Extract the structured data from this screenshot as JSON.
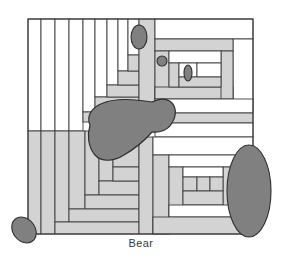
{
  "figure": {
    "caption": "Bear",
    "title": "Bear",
    "type": "quilt-block-diagram",
    "canvas": {
      "width": 282,
      "height": 266
    }
  },
  "colors": {
    "background": "#ffffff",
    "patch_light": "#ffffff",
    "patch_gray": "#d3d3d3",
    "applique_dark": "#808080",
    "outline": "#3c3c3c",
    "caption_text": "#3a3a3a"
  },
  "block": {
    "bounds": {
      "x": 28,
      "y": 19,
      "width": 225,
      "height": 215
    },
    "patches": [
      {
        "name": "strip-left-1",
        "x": 28,
        "y": 19,
        "w": 13,
        "h": 112,
        "fill": "#ffffff"
      },
      {
        "name": "strip-left-2",
        "x": 41,
        "y": 19,
        "w": 14,
        "h": 112,
        "fill": "#ffffff"
      },
      {
        "name": "strip-left-3",
        "x": 55,
        "y": 19,
        "w": 14,
        "h": 112,
        "fill": "#ffffff"
      },
      {
        "name": "strip-left-4",
        "x": 69,
        "y": 19,
        "w": 14,
        "h": 112,
        "fill": "#ffffff"
      },
      {
        "name": "strip-left-5",
        "x": 83,
        "y": 19,
        "w": 12,
        "h": 93,
        "fill": "#ffffff"
      },
      {
        "name": "strip-left-6",
        "x": 95,
        "y": 19,
        "w": 12,
        "h": 78,
        "fill": "#ffffff"
      },
      {
        "name": "strip-left-7",
        "x": 107,
        "y": 19,
        "w": 11,
        "h": 66,
        "fill": "#ffffff"
      },
      {
        "name": "strip-left-8",
        "x": 118,
        "y": 19,
        "w": 10,
        "h": 52,
        "fill": "#ffffff"
      },
      {
        "name": "strip-left-9",
        "x": 128,
        "y": 19,
        "w": 11,
        "h": 36,
        "fill": "#ffffff"
      },
      {
        "name": "step-gray-1",
        "x": 83,
        "y": 112,
        "w": 56,
        "h": 10,
        "fill": "#d3d3d3"
      },
      {
        "name": "step-gray-2",
        "x": 95,
        "y": 97,
        "w": 44,
        "h": 15,
        "fill": "#d3d3d3"
      },
      {
        "name": "step-gray-3",
        "x": 107,
        "y": 85,
        "w": 32,
        "h": 12,
        "fill": "#d3d3d3"
      },
      {
        "name": "step-gray-4",
        "x": 118,
        "y": 71,
        "w": 21,
        "h": 14,
        "fill": "#d3d3d3"
      },
      {
        "name": "step-gray-5",
        "x": 128,
        "y": 55,
        "w": 11,
        "h": 16,
        "fill": "#d3d3d3"
      },
      {
        "name": "neck-column",
        "x": 139,
        "y": 19,
        "w": 16,
        "h": 112,
        "fill": "#d3d3d3"
      },
      {
        "name": "head-top-white",
        "x": 155,
        "y": 19,
        "w": 98,
        "h": 20,
        "fill": "#ffffff"
      },
      {
        "name": "head-right-white",
        "x": 233,
        "y": 39,
        "w": 20,
        "h": 72,
        "fill": "#ffffff"
      },
      {
        "name": "head-gray-outer",
        "x": 155,
        "y": 39,
        "w": 78,
        "h": 12,
        "fill": "#d3d3d3"
      },
      {
        "name": "head-left-gray",
        "x": 155,
        "y": 51,
        "w": 14,
        "h": 48,
        "fill": "#d3d3d3"
      },
      {
        "name": "head-bottom-gray",
        "x": 155,
        "y": 87,
        "w": 78,
        "h": 12,
        "fill": "#d3d3d3"
      },
      {
        "name": "head-right-gray",
        "x": 221,
        "y": 51,
        "w": 12,
        "h": 48,
        "fill": "#d3d3d3"
      },
      {
        "name": "muzzle-white-1",
        "x": 169,
        "y": 51,
        "w": 52,
        "h": 12,
        "fill": "#ffffff"
      },
      {
        "name": "muzzle-left-gray",
        "x": 169,
        "y": 63,
        "w": 10,
        "h": 24,
        "fill": "#d3d3d3"
      },
      {
        "name": "muzzle-cell-1",
        "x": 179,
        "y": 63,
        "w": 18,
        "h": 14,
        "fill": "#ffffff"
      },
      {
        "name": "muzzle-cell-2",
        "x": 197,
        "y": 63,
        "w": 24,
        "h": 14,
        "fill": "#ffffff"
      },
      {
        "name": "muzzle-bottom-gray",
        "x": 179,
        "y": 77,
        "w": 42,
        "h": 10,
        "fill": "#d3d3d3"
      },
      {
        "name": "chest-white-band",
        "x": 155,
        "y": 99,
        "w": 98,
        "h": 14,
        "fill": "#ffffff"
      },
      {
        "name": "back-gray-band",
        "x": 155,
        "y": 113,
        "w": 98,
        "h": 10,
        "fill": "#d3d3d3"
      },
      {
        "name": "back-white-band",
        "x": 155,
        "y": 123,
        "w": 98,
        "h": 14,
        "fill": "#ffffff"
      },
      {
        "name": "body-left-gray",
        "x": 28,
        "y": 131,
        "w": 13,
        "h": 103,
        "fill": "#d3d3d3"
      },
      {
        "name": "body-strip-2",
        "x": 41,
        "y": 131,
        "w": 14,
        "h": 103,
        "fill": "#d3d3d3"
      },
      {
        "name": "body-strip-3",
        "x": 55,
        "y": 131,
        "w": 14,
        "h": 91,
        "fill": "#d3d3d3"
      },
      {
        "name": "body-strip-4",
        "x": 69,
        "y": 131,
        "w": 16,
        "h": 78,
        "fill": "#d3d3d3"
      },
      {
        "name": "body-strip-5",
        "x": 85,
        "y": 131,
        "w": 14,
        "h": 64,
        "fill": "#d3d3d3"
      },
      {
        "name": "body-strip-6",
        "x": 99,
        "y": 131,
        "w": 14,
        "h": 50,
        "fill": "#d3d3d3"
      },
      {
        "name": "body-strip-7",
        "x": 113,
        "y": 131,
        "w": 26,
        "h": 36,
        "fill": "#d3d3d3"
      },
      {
        "name": "body-step-1",
        "x": 99,
        "y": 181,
        "w": 40,
        "h": 14,
        "fill": "#d3d3d3"
      },
      {
        "name": "body-step-2",
        "x": 85,
        "y": 195,
        "w": 54,
        "h": 14,
        "fill": "#d3d3d3"
      },
      {
        "name": "body-step-3",
        "x": 69,
        "y": 209,
        "w": 70,
        "h": 13,
        "fill": "#d3d3d3"
      },
      {
        "name": "body-step-4",
        "x": 55,
        "y": 222,
        "w": 84,
        "h": 12,
        "fill": "#d3d3d3"
      },
      {
        "name": "inner-step-a",
        "x": 113,
        "y": 167,
        "w": 26,
        "h": 14,
        "fill": "#d3d3d3"
      },
      {
        "name": "center-divider",
        "x": 139,
        "y": 137,
        "w": 14,
        "h": 97,
        "fill": "#d3d3d3"
      },
      {
        "name": "hind-white-band",
        "x": 153,
        "y": 137,
        "w": 100,
        "h": 18,
        "fill": "#ffffff"
      },
      {
        "name": "hind-left-gray",
        "x": 153,
        "y": 155,
        "w": 16,
        "h": 79,
        "fill": "#d3d3d3"
      },
      {
        "name": "hind-white-2",
        "x": 169,
        "y": 155,
        "w": 84,
        "h": 12,
        "fill": "#ffffff"
      },
      {
        "name": "hind-inner-left",
        "x": 169,
        "y": 167,
        "w": 14,
        "h": 50,
        "fill": "#d3d3d3"
      },
      {
        "name": "hind-inner-right",
        "x": 223,
        "y": 167,
        "w": 14,
        "h": 50,
        "fill": "#d3d3d3"
      },
      {
        "name": "hind-inner-white",
        "x": 183,
        "y": 167,
        "w": 40,
        "h": 10,
        "fill": "#ffffff"
      },
      {
        "name": "paw-cell-1",
        "x": 183,
        "y": 177,
        "w": 14,
        "h": 14,
        "fill": "#d3d3d3"
      },
      {
        "name": "paw-cell-2",
        "x": 197,
        "y": 177,
        "w": 13,
        "h": 14,
        "fill": "#d3d3d3"
      },
      {
        "name": "paw-cell-3",
        "x": 210,
        "y": 177,
        "w": 13,
        "h": 14,
        "fill": "#d3d3d3"
      },
      {
        "name": "hind-inner-bottom",
        "x": 183,
        "y": 191,
        "w": 40,
        "h": 14,
        "fill": "#d3d3d3"
      },
      {
        "name": "hind-white-3",
        "x": 169,
        "y": 205,
        "w": 68,
        "h": 12,
        "fill": "#ffffff"
      },
      {
        "name": "hind-bottom-gray",
        "x": 153,
        "y": 217,
        "w": 100,
        "h": 17,
        "fill": "#d3d3d3"
      },
      {
        "name": "hind-right-gray",
        "x": 237,
        "y": 155,
        "w": 16,
        "h": 62,
        "fill": "#d3d3d3"
      }
    ],
    "appliques": [
      {
        "name": "bear-body-blob",
        "shape": "blob",
        "label": "body"
      },
      {
        "name": "bear-ear-oval",
        "shape": "ellipse",
        "cx": 139,
        "cy": 37,
        "rx": 8,
        "ry": 12,
        "rotation": 0
      },
      {
        "name": "bear-eye-oval",
        "shape": "ellipse",
        "cx": 162,
        "cy": 61,
        "rx": 5,
        "ry": 5,
        "rotation": 0
      },
      {
        "name": "bear-nose-oval",
        "shape": "ellipse",
        "cx": 188,
        "cy": 73,
        "rx": 4,
        "ry": 8,
        "rotation": 0
      },
      {
        "name": "bear-haunch-oval",
        "shape": "ellipse",
        "cx": 249,
        "cy": 191,
        "rx": 22,
        "ry": 46,
        "rotation": 0
      },
      {
        "name": "bear-foot-oval",
        "shape": "ellipse",
        "cx": 24,
        "cy": 230,
        "rx": 11,
        "ry": 14,
        "rotation": -38
      }
    ]
  }
}
